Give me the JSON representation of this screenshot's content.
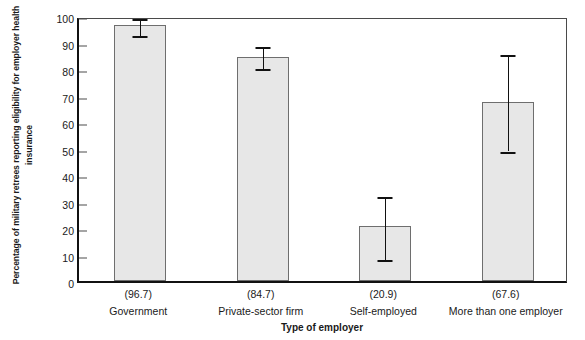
{
  "chart_data": {
    "type": "bar",
    "title": "",
    "xlabel": "Type of employer",
    "ylabel": "Percentage of military retrees reporting eligibility for employer health insurance",
    "categories": [
      "Government",
      "Private-sector firm",
      "Self-employed",
      "More than one employer"
    ],
    "value_labels": [
      "(96.7)",
      "(84.7)",
      "(20.9)",
      "(67.6)"
    ],
    "values": [
      96.7,
      84.7,
      20.9,
      67.6
    ],
    "error_low": [
      93.5,
      81.0,
      9.0,
      50.0
    ],
    "error_high": [
      99.9,
      89.5,
      33.0,
      86.5
    ],
    "ylim": [
      0,
      100
    ],
    "yticks": [
      0,
      10,
      20,
      30,
      40,
      50,
      60,
      70,
      80,
      90,
      100
    ],
    "ytick_labels": [
      "0",
      "10",
      "20",
      "30",
      "40",
      "50",
      "60",
      "70",
      "80",
      "90",
      "100"
    ],
    "grid": false,
    "legend": null,
    "bar_fill_color": "#e7e7e7",
    "bar_edge_color": "#6e6e6e",
    "error_bar_color": "#111111",
    "axis_color": "#111111"
  },
  "footer": {
    "clipped_caption": ""
  }
}
